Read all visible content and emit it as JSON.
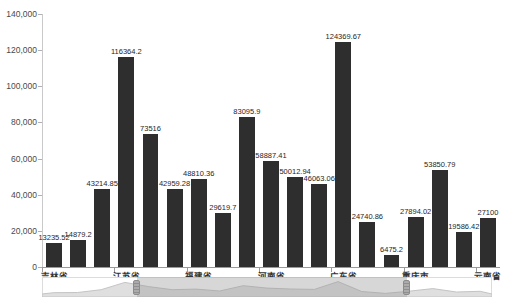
{
  "chart_data": {
    "type": "bar",
    "title": "",
    "xlabel": "",
    "ylabel": "",
    "categories": [
      "吉林省",
      "",
      "",
      "江苏省",
      "",
      "",
      "福建省",
      "",
      "",
      "河南省",
      "",
      "",
      "广东省",
      "",
      "",
      "重庆市",
      "",
      "",
      "云南省"
    ],
    "values": [
      13235.52,
      14879.2,
      43214.85,
      116364.2,
      73516,
      42959.28,
      48810.36,
      29619.7,
      83095.9,
      58887.41,
      50012.94,
      46063.06,
      124369.67,
      24740.86,
      6475.2,
      27894.02,
      53850.79,
      19586.42,
      27100
    ],
    "bar_labels": [
      "13235.52",
      "14879.2",
      "43214.85",
      "116364.2",
      "73516",
      "42959.28",
      "48810.36",
      "29619.7",
      "83095.9",
      "58887.41",
      "50012.94",
      "46063.06",
      "124369.67",
      "24740.86",
      "6475.2",
      "27894.02",
      "53850.79",
      "19586.42",
      "27100"
    ],
    "y_tick_labels": [
      "0",
      "20,000",
      "40,000",
      "60,000",
      "80,000",
      "100,000",
      "120,000",
      "140,000"
    ],
    "ylim": [
      0,
      140000
    ],
    "y_tick_step": 20000,
    "grid": false,
    "legend": null,
    "colors": {
      "bar": "#2e2e2e",
      "bar_label": "#1f1f1f",
      "axis": "#9a9a9a",
      "tick_text": "#4a4a4a",
      "background": "#ffffff"
    },
    "datazoom": {
      "start_pct": 21.1,
      "end_pct": 81.1,
      "track_color": "#ffffff",
      "border_color": "#dcdcdc",
      "selected_fill": "rgba(150,150,150,0.38)",
      "silhouette_fill": "#dfdfdf",
      "silhouette_line": "#c4c4c4",
      "handle_fill": "#a3a3a3"
    }
  }
}
